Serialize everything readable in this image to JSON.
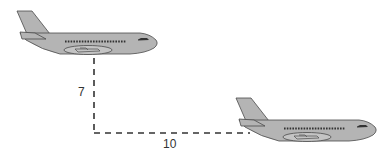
{
  "diagram": {
    "type": "distance-diagram",
    "elements": {
      "airplane_upper": {
        "label": "airplane",
        "position": "upper-left"
      },
      "airplane_lower": {
        "label": "airplane",
        "position": "lower-right"
      }
    },
    "measurements": {
      "vertical": {
        "value": "7",
        "orientation": "vertical"
      },
      "horizontal": {
        "value": "10",
        "orientation": "horizontal"
      }
    },
    "colors": {
      "plane_fill": "#b4b4b4",
      "plane_stroke": "#4a4a4a",
      "window_color": "#333333",
      "dash_color": "#333333",
      "label_color": "#333333"
    }
  }
}
